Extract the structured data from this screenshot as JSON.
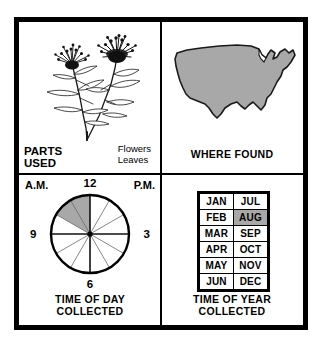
{
  "figure": {
    "gray": "#a8a8a8",
    "ink": "#000000",
    "paper": "#ffffff"
  },
  "panels": {
    "parts_used": {
      "caption": "PARTS\nUSED",
      "items_text": "Flowers\nLeaves",
      "items": [
        "Flowers",
        "Leaves"
      ],
      "illustration": "flowering-plant-illustration"
    },
    "where_found": {
      "caption": "WHERE FOUND",
      "illustration": "united-states-map",
      "region_shaded": "entire continental united states"
    },
    "time_of_day": {
      "caption": "TIME OF DAY\nCOLLECTED",
      "am_label": "A.M.",
      "pm_label": "P.M.",
      "numerals": [
        "12",
        "3",
        "6",
        "9"
      ],
      "num_12": "12",
      "num_3": "3",
      "num_6": "6",
      "num_9": "9",
      "illustration": "clock-dial-12-segments",
      "shaded_from_hour": 10,
      "shaded_to_hour": 12,
      "shaded_period": "A.M."
    },
    "time_of_year": {
      "caption": "TIME OF YEAR\nCOLLECTED",
      "months_grid": [
        [
          "JAN",
          "JUL"
        ],
        [
          "FEB",
          "AUG"
        ],
        [
          "MAR",
          "SEP"
        ],
        [
          "APR",
          "OCT"
        ],
        [
          "MAY",
          "NOV"
        ],
        [
          "JUN",
          "DEC"
        ]
      ],
      "highlighted_months": [
        "AUG"
      ]
    }
  }
}
